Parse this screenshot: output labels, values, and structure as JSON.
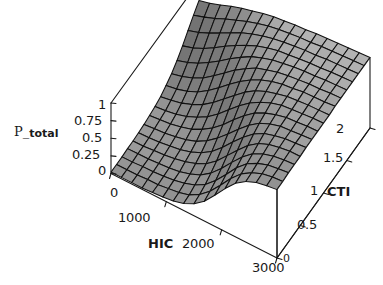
{
  "chart_data": {
    "type": "surface3d",
    "title": "",
    "xlabel": "HIC",
    "ylabel": "CTI",
    "zlabel": "P_ total",
    "zlabel_main": "P_",
    "zlabel_sub": "total",
    "xlim": [
      0,
      3000
    ],
    "ylim": [
      0,
      2
    ],
    "zlim": [
      0,
      1
    ],
    "x_ticks": [
      "0",
      "1000",
      "2000",
      "3000"
    ],
    "x_tick_values": [
      0,
      1000,
      2000,
      3000
    ],
    "y_ticks": [
      "0",
      "0.5",
      "1",
      "1.5",
      "2"
    ],
    "y_tick_values": [
      0,
      0.5,
      1,
      1.5,
      2
    ],
    "z_ticks": [
      "0",
      "0.25",
      "0.5",
      "0.75",
      "1"
    ],
    "z_tick_values": [
      0,
      0.25,
      0.5,
      0.75,
      1
    ],
    "grid": true,
    "legend": false,
    "mesh_nx": 16,
    "mesh_ny": 16,
    "surface_color_dark": "#6a6a6a",
    "surface_color_light": "#b4b4b4",
    "mesh_line_color": "#111111",
    "axis_line_color": "#1a1a1a",
    "background_color": "#ffffff",
    "z_values": [
      [
        0.02,
        0.02,
        0.02,
        0.02,
        0.03,
        0.04,
        0.06,
        0.1,
        0.17,
        0.28,
        0.44,
        0.61,
        0.76,
        0.86,
        0.92,
        0.95,
        0.97
      ],
      [
        0.02,
        0.02,
        0.02,
        0.03,
        0.03,
        0.05,
        0.07,
        0.11,
        0.19,
        0.31,
        0.47,
        0.64,
        0.78,
        0.87,
        0.93,
        0.96,
        0.97
      ],
      [
        0.02,
        0.02,
        0.03,
        0.03,
        0.04,
        0.06,
        0.09,
        0.14,
        0.22,
        0.35,
        0.51,
        0.68,
        0.81,
        0.89,
        0.94,
        0.96,
        0.98
      ],
      [
        0.03,
        0.03,
        0.03,
        0.04,
        0.05,
        0.07,
        0.11,
        0.17,
        0.27,
        0.41,
        0.57,
        0.72,
        0.84,
        0.91,
        0.95,
        0.97,
        0.98
      ],
      [
        0.03,
        0.03,
        0.04,
        0.05,
        0.07,
        0.1,
        0.15,
        0.22,
        0.33,
        0.48,
        0.63,
        0.77,
        0.87,
        0.93,
        0.96,
        0.98,
        0.98
      ],
      [
        0.04,
        0.04,
        0.05,
        0.07,
        0.09,
        0.13,
        0.19,
        0.28,
        0.41,
        0.56,
        0.7,
        0.82,
        0.9,
        0.94,
        0.97,
        0.98,
        0.99
      ],
      [
        0.05,
        0.06,
        0.07,
        0.09,
        0.12,
        0.17,
        0.25,
        0.36,
        0.49,
        0.63,
        0.76,
        0.86,
        0.92,
        0.96,
        0.97,
        0.98,
        0.99
      ],
      [
        0.07,
        0.08,
        0.09,
        0.12,
        0.16,
        0.23,
        0.32,
        0.44,
        0.58,
        0.71,
        0.82,
        0.89,
        0.94,
        0.97,
        0.98,
        0.99,
        0.99
      ],
      [
        0.09,
        0.1,
        0.12,
        0.16,
        0.22,
        0.3,
        0.41,
        0.54,
        0.67,
        0.78,
        0.86,
        0.92,
        0.96,
        0.97,
        0.98,
        0.99,
        0.99
      ],
      [
        0.12,
        0.14,
        0.17,
        0.22,
        0.29,
        0.39,
        0.51,
        0.63,
        0.75,
        0.84,
        0.9,
        0.94,
        0.97,
        0.98,
        0.99,
        0.99,
        0.99
      ],
      [
        0.17,
        0.19,
        0.23,
        0.29,
        0.38,
        0.49,
        0.61,
        0.72,
        0.81,
        0.88,
        0.93,
        0.96,
        0.97,
        0.99,
        0.99,
        0.99,
        1.0
      ],
      [
        0.23,
        0.26,
        0.31,
        0.38,
        0.48,
        0.59,
        0.7,
        0.79,
        0.87,
        0.91,
        0.95,
        0.97,
        0.98,
        0.99,
        0.99,
        1.0,
        1.0
      ],
      [
        0.31,
        0.35,
        0.41,
        0.49,
        0.58,
        0.68,
        0.77,
        0.85,
        0.9,
        0.94,
        0.96,
        0.98,
        0.99,
        0.99,
        1.0,
        1.0,
        1.0
      ],
      [
        0.41,
        0.45,
        0.51,
        0.59,
        0.68,
        0.76,
        0.83,
        0.89,
        0.93,
        0.96,
        0.97,
        0.98,
        0.99,
        0.99,
        1.0,
        1.0,
        1.0
      ],
      [
        0.52,
        0.56,
        0.62,
        0.69,
        0.76,
        0.83,
        0.88,
        0.92,
        0.95,
        0.97,
        0.98,
        0.99,
        0.99,
        1.0,
        1.0,
        1.0,
        1.0
      ],
      [
        0.63,
        0.67,
        0.72,
        0.78,
        0.83,
        0.88,
        0.92,
        0.95,
        0.97,
        0.98,
        0.99,
        0.99,
        1.0,
        1.0,
        1.0,
        1.0,
        1.0
      ],
      [
        0.73,
        0.76,
        0.8,
        0.85,
        0.89,
        0.92,
        0.95,
        0.97,
        0.98,
        0.99,
        0.99,
        1.0,
        1.0,
        1.0,
        1.0,
        1.0,
        1.0
      ]
    ]
  },
  "axes": {
    "x": {
      "name": "HIC",
      "ticks": [
        {
          "label": "0",
          "left": 110,
          "top": 186
        },
        {
          "label": "1000",
          "left": 118,
          "top": 211
        },
        {
          "label": "2000",
          "left": 182,
          "top": 237
        },
        {
          "label": "3000",
          "left": 252,
          "top": 261
        }
      ],
      "name_pos": {
        "left": 148,
        "top": 237
      }
    },
    "y": {
      "name": "CTI",
      "ticks": [
        {
          "label": "0",
          "left": 283,
          "top": 252
        },
        {
          "label": "0.5",
          "left": 297,
          "top": 218
        },
        {
          "label": "1",
          "left": 310,
          "top": 184
        },
        {
          "label": "1.5",
          "left": 323,
          "top": 151
        },
        {
          "label": "2",
          "left": 336,
          "top": 122
        }
      ],
      "name_pos": {
        "left": 327,
        "top": 185
      }
    },
    "z": {
      "name": "P_ total",
      "ticks": [
        {
          "label": "1",
          "left": 98,
          "top": 98
        },
        {
          "label": "0.75",
          "left": 74,
          "top": 114
        },
        {
          "label": "0.5",
          "left": 82,
          "top": 131
        },
        {
          "label": "0.25",
          "left": 72,
          "top": 148
        },
        {
          "label": "0",
          "left": 98,
          "top": 164
        }
      ],
      "name_pos": {
        "left": 14,
        "top": 124
      }
    }
  }
}
